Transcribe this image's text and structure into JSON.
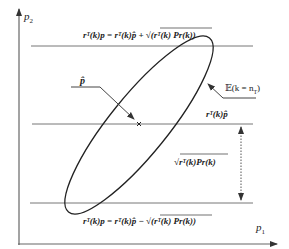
{
  "axes": {
    "y_label": "p",
    "y_label_sub": "2",
    "x_label": "p",
    "x_label_sub": "1"
  },
  "lines": {
    "upper_equation": "rᵀ(k)p = rᵀ(k)p̂ + √(rᵀ(k) Pr(k))",
    "lower_equation": "rᵀ(k)p = rᵀ(k)p̂ − √(rᵀ(k) Pr(k))",
    "center_label": "rᵀ(k)p̂"
  },
  "annotations": {
    "estimate_label": "p̂",
    "ellipse_label": "𝔼(k = n",
    "ellipse_label_sub": "T",
    "ellipse_label_close": ")",
    "distance_label": "√rᵀ(k)Pr(k)"
  },
  "colors": {
    "line": "#555555",
    "ellipse": "#222222",
    "background": "#ffffff"
  }
}
